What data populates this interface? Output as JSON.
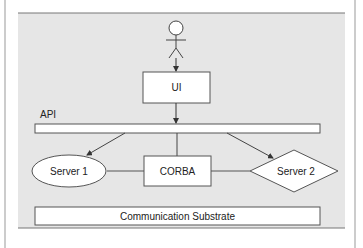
{
  "diagram": {
    "actor": {
      "label": ""
    },
    "ui": {
      "label": "UI"
    },
    "api": {
      "label": "API"
    },
    "server1": {
      "label": "Server 1"
    },
    "corba": {
      "label": "CORBA"
    },
    "server2": {
      "label": "Server 2"
    },
    "substrate": {
      "label": "Communication Substrate"
    }
  },
  "colors": {
    "panel_bg": "#e6e6e6",
    "node_fill": "#ffffff",
    "stroke": "#444444"
  }
}
